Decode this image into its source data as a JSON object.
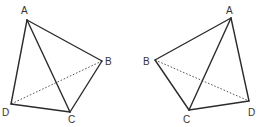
{
  "figures": [
    {
      "name": "left-tetrahedron",
      "vertices": {
        "A": {
          "label": "A",
          "x": 27,
          "y": 20,
          "lx": 21,
          "ly": 14
        },
        "B": {
          "label": "B",
          "x": 102,
          "y": 61,
          "lx": 105,
          "ly": 65
        },
        "C": {
          "label": "C",
          "x": 70,
          "y": 112,
          "lx": 68,
          "ly": 123
        },
        "D": {
          "label": "D",
          "x": 11,
          "y": 104,
          "lx": 2,
          "ly": 116
        }
      },
      "solid_edges": [
        "AB",
        "AC",
        "AD",
        "BC",
        "CD"
      ],
      "dashed_edges": [
        "BD"
      ]
    },
    {
      "name": "right-tetrahedron",
      "vertices": {
        "A": {
          "label": "A",
          "x": 231,
          "y": 18,
          "lx": 226,
          "ly": 14
        },
        "B": {
          "label": "B",
          "x": 155,
          "y": 60,
          "lx": 143,
          "ly": 65
        },
        "C": {
          "label": "C",
          "x": 189,
          "y": 110,
          "lx": 183,
          "ly": 123
        },
        "D": {
          "label": "D",
          "x": 249,
          "y": 101,
          "lx": 248,
          "ly": 116
        }
      },
      "solid_edges": [
        "AB",
        "AC",
        "AD",
        "BC",
        "CD"
      ],
      "dashed_edges": [
        "BD"
      ]
    }
  ],
  "colors": {
    "line": "#2b2b2b",
    "text": "#333333",
    "background": "#ffffff"
  }
}
